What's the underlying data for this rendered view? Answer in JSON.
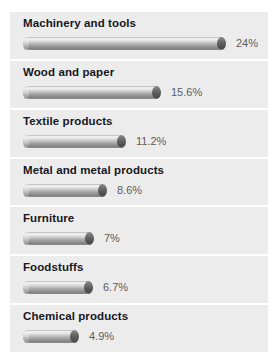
{
  "chart_data": {
    "type": "bar",
    "title": "",
    "xlabel": "",
    "ylabel": "",
    "orientation": "horizontal",
    "grid": false,
    "legend": false,
    "value_suffix": "%",
    "xlim": [
      0,
      26
    ],
    "categories": [
      "Machinery and tools",
      "Wood and paper",
      "Textile products",
      "Metal and metal products",
      "Furniture",
      "Foodstuffs",
      "Chemical products"
    ],
    "values": [
      24,
      15.6,
      11.2,
      8.6,
      7,
      6.7,
      4.9
    ],
    "value_labels": [
      "24%",
      "15.6%",
      "11.2%",
      "8.6%",
      "7%",
      "6.7%",
      "4.9%"
    ]
  },
  "style": {
    "panel_background": "#ececec",
    "page_background": "#ffffff",
    "label_color": "#17171f",
    "value_color": "#5d5d5d",
    "bar_highlight": "#f3f3f3",
    "bar_shadow": "#7e7e7e",
    "bar_cap": "#4c4c4c"
  },
  "rows": [
    {
      "label": "Machinery and tools",
      "value": 24,
      "value_label": "24%",
      "bar_px": 202
    },
    {
      "label": "Wood and paper",
      "value": 15.6,
      "value_label": "15.6%",
      "bar_px": 137
    },
    {
      "label": "Textile products",
      "value": 11.2,
      "value_label": "11.2%",
      "bar_px": 102
    },
    {
      "label": "Metal and metal products",
      "value": 8.6,
      "value_label": "8.6%",
      "bar_px": 83
    },
    {
      "label": "Furniture",
      "value": 7,
      "value_label": "7%",
      "bar_px": 70
    },
    {
      "label": "Foodstuffs",
      "value": 6.7,
      "value_label": "6.7%",
      "bar_px": 69
    },
    {
      "label": "Chemical products",
      "value": 4.9,
      "value_label": "4.9%",
      "bar_px": 55
    }
  ]
}
